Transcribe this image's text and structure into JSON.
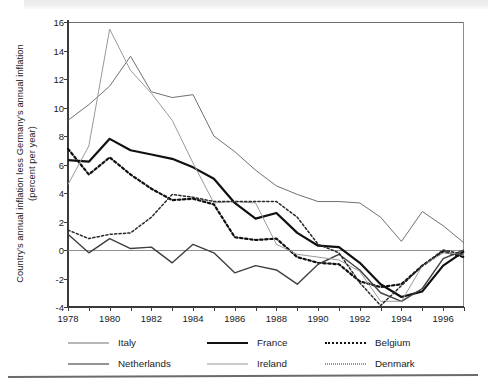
{
  "chart_data": {
    "type": "line",
    "title": "",
    "xlabel": "",
    "ylabel": "Country's annual inflation less Germany's annual inflation\n(percent per year)",
    "xlim": [
      1978,
      1997
    ],
    "ylim": [
      -4,
      16
    ],
    "grid": false,
    "legend_position": "bottom",
    "x": [
      1978,
      1979,
      1980,
      1981,
      1982,
      1983,
      1984,
      1985,
      1986,
      1987,
      1988,
      1989,
      1990,
      1991,
      1992,
      1993,
      1994,
      1995,
      1996,
      1997
    ],
    "xtick_labels": [
      "1978",
      "1980",
      "1982",
      "1984",
      "1986",
      "1988",
      "1990",
      "1992",
      "1994",
      "1996"
    ],
    "xtick_values": [
      1978,
      1980,
      1982,
      1984,
      1986,
      1988,
      1990,
      1992,
      1994,
      1996
    ],
    "ytick_labels": [
      "16",
      "14",
      "12",
      "10",
      "8",
      "6",
      "4",
      "2",
      "0",
      "-2",
      "-4"
    ],
    "ytick_values": [
      16,
      14,
      12,
      10,
      8,
      6,
      4,
      2,
      0,
      -2,
      -4
    ],
    "zero_reference_line": 0,
    "series": [
      {
        "name": "Italy",
        "style": "solid",
        "width": 1.0,
        "color": "#707070",
        "values": [
          9.1,
          10.2,
          11.5,
          13.6,
          11.1,
          10.7,
          10.9,
          8.0,
          6.9,
          5.6,
          4.5,
          3.9,
          3.4,
          3.4,
          3.3,
          2.3,
          0.6,
          2.7,
          1.7,
          0.5
        ]
      },
      {
        "name": "France",
        "style": "solid",
        "width": 2.2,
        "color": "#101010",
        "values": [
          6.3,
          6.2,
          7.8,
          7.0,
          6.7,
          6.4,
          5.8,
          5.0,
          3.3,
          2.2,
          2.6,
          1.2,
          0.3,
          0.2,
          -0.9,
          -2.4,
          -3.3,
          -2.9,
          -1.1,
          -0.1
        ]
      },
      {
        "name": "Belgium",
        "style": "dotted-thick",
        "width": 2.2,
        "color": "#101010",
        "values": [
          7.1,
          5.3,
          6.5,
          5.3,
          4.3,
          3.5,
          3.6,
          3.2,
          0.9,
          0.7,
          0.8,
          -0.5,
          -0.9,
          -1.0,
          -2.2,
          -2.6,
          -2.4,
          -1.1,
          -0.1,
          -0.5
        ]
      },
      {
        "name": "Netherlands",
        "style": "solid",
        "width": 1.4,
        "color": "#3f3f3f",
        "values": [
          1.1,
          -0.2,
          0.8,
          0.1,
          0.2,
          -0.9,
          0.4,
          -0.2,
          -1.6,
          -1.1,
          -1.4,
          -2.4,
          -1.0,
          -0.3,
          -1.4,
          -3.0,
          -3.6,
          -2.7,
          -0.6,
          0.0
        ]
      },
      {
        "name": "Ireland",
        "style": "solid",
        "width": 1.0,
        "color": "#9a9a9a",
        "values": [
          4.6,
          7.3,
          15.5,
          12.6,
          11.0,
          9.1,
          6.1,
          3.3,
          3.4,
          3.3,
          0.4,
          -0.3,
          -0.5,
          -0.7,
          -1.5,
          -3.6,
          -3.6,
          -1.1,
          -0.2,
          -0.3
        ]
      },
      {
        "name": "Denmark",
        "style": "dotted-thin",
        "width": 1.5,
        "color": "#2a2a2a",
        "values": [
          1.4,
          0.8,
          1.1,
          1.2,
          2.3,
          3.9,
          3.7,
          3.4,
          3.4,
          3.4,
          3.4,
          2.3,
          0.4,
          -0.2,
          -2.3,
          -3.9,
          -2.5,
          -1.1,
          0.0,
          -0.3
        ]
      }
    ]
  },
  "legend": {
    "rows": [
      [
        {
          "name": "Italy",
          "style": "solid",
          "width": 1.0,
          "color": "#707070"
        },
        {
          "name": "France",
          "style": "solid",
          "width": 2.4,
          "color": "#101010"
        },
        {
          "name": "Belgium",
          "style": "dotted-thick",
          "width": 2.4,
          "color": "#101010"
        }
      ],
      [
        {
          "name": "Netherlands",
          "style": "solid",
          "width": 1.6,
          "color": "#2a2a2a"
        },
        {
          "name": "Ireland",
          "style": "solid",
          "width": 1.0,
          "color": "#9a9a9a"
        },
        {
          "name": "Denmark",
          "style": "dotted-thin",
          "width": 1.5,
          "color": "#2a2a2a"
        }
      ]
    ]
  }
}
